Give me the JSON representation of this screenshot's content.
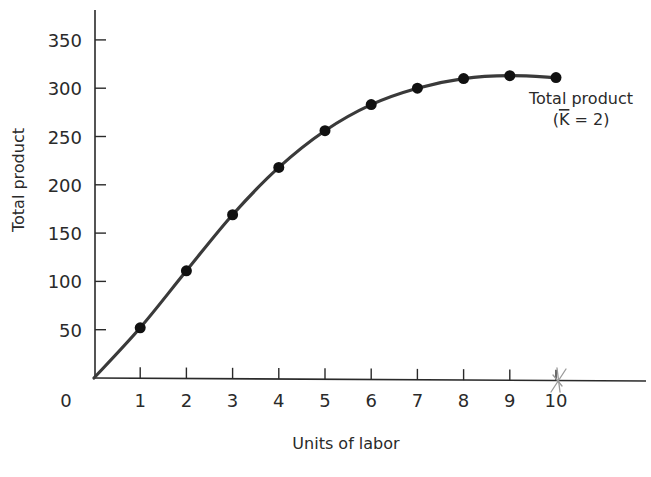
{
  "chart_data": {
    "type": "line",
    "title": "",
    "xlabel": "Units of labor",
    "ylabel": "Total product",
    "x": [
      0,
      1,
      2,
      3,
      4,
      5,
      6,
      7,
      8,
      9,
      10
    ],
    "series": [
      {
        "name": "Total product (K̄ = 2)",
        "values": [
          0,
          52,
          111,
          169,
          218,
          256,
          283,
          300,
          310,
          313,
          311
        ],
        "markers": true,
        "color": "#3a3a3a"
      }
    ],
    "xticks": [
      "1",
      "2",
      "3",
      "4",
      "5",
      "6",
      "7",
      "8",
      "9",
      "10"
    ],
    "yticks": [
      "50",
      "100",
      "150",
      "200",
      "250",
      "300",
      "350"
    ],
    "origin_label": "0",
    "xlim": [
      0,
      11.5
    ],
    "ylim": [
      0,
      370
    ],
    "grid": false,
    "legend": "none",
    "annotations": [
      {
        "text_line1": "Total product",
        "text_line2": "(K̄ = 2)",
        "anchor_x": 10
      },
      {
        "text": "pencil scribble mark",
        "anchor_x": 10,
        "anchor_y": 0,
        "color": "#9a9a9a"
      }
    ]
  },
  "labels": {
    "y_axis_title": "Total product",
    "x_axis_title": "Units of labor",
    "origin": "0",
    "series_label_line1": "Total product",
    "series_label_line2_open": "(",
    "series_label_line2_k": "K",
    "series_label_line2_rest": " = 2)"
  }
}
